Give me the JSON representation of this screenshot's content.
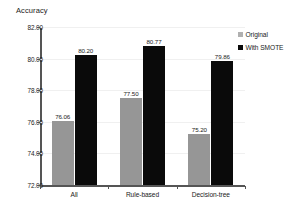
{
  "chart_data": {
    "type": "bar",
    "title": "Accuracy",
    "xlabel": "",
    "ylabel": "",
    "ylim": [
      72.0,
      82.0
    ],
    "ytick_step": 2.0,
    "ytick_labels": [
      "72.00",
      "74.00",
      "76.00",
      "78.00",
      "80.00",
      "82.00"
    ],
    "grid": true,
    "legend_position": "right",
    "categories": [
      "All",
      "Rule-based",
      "Decision-tree"
    ],
    "series": [
      {
        "name": "Original",
        "color": "#969696",
        "values": [
          76.06,
          77.5,
          75.2
        ],
        "labels": [
          "76.06",
          "77.50",
          "75.20"
        ]
      },
      {
        "name": "With SMOTE",
        "color": "#0a0a0a",
        "values": [
          80.2,
          80.77,
          79.86
        ],
        "labels": [
          "80.20",
          "80.77",
          "79.86"
        ]
      }
    ]
  },
  "legend": {
    "items": [
      {
        "label": "Original",
        "marker": "square-gray"
      },
      {
        "label": "With SMOTE",
        "marker": "square-black"
      }
    ]
  }
}
